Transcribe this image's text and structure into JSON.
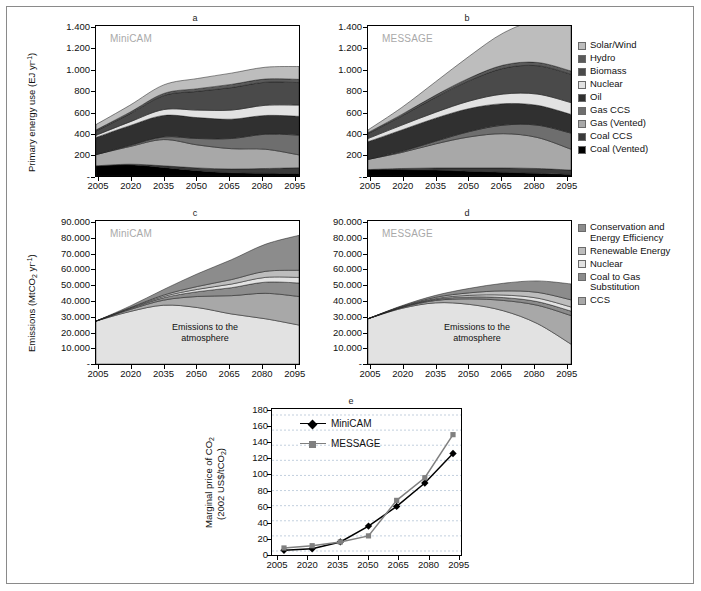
{
  "figure": {
    "panels": [
      "a",
      "b",
      "c",
      "d",
      "e"
    ]
  },
  "panel_a": {
    "letter": "a",
    "model_tag": "MiniCAM",
    "ylabel_main": "Primary energy use (EJ yr",
    "ylabel_sup": "-1",
    "ylabel_end": ")",
    "yticks": [
      "1.400",
      "1.200",
      "1.000",
      "800",
      "600",
      "400",
      "200",
      "-"
    ],
    "xticks": [
      "2005",
      "2020",
      "2035",
      "2050",
      "2065",
      "2080",
      "2095"
    ]
  },
  "panel_b": {
    "letter": "b",
    "model_tag": "MESSAGE",
    "yticks": [
      "1.400",
      "1.200",
      "1.000",
      "800",
      "600",
      "400",
      "200",
      "-"
    ],
    "xticks": [
      "2005",
      "2020",
      "2035",
      "2050",
      "2065",
      "2080",
      "2095"
    ]
  },
  "panel_c": {
    "letter": "c",
    "model_tag": "MiniCAM",
    "ylabel_pre": "Emissions (MtCO",
    "ylabel_sub": "2",
    "ylabel_mid": " yr",
    "ylabel_sup": "-1",
    "ylabel_end": ")",
    "yticks": [
      "90.000",
      "80.000",
      "70.000",
      "60.000",
      "50.000",
      "40.000",
      "30.000",
      "20.000",
      "10.000",
      "-"
    ],
    "xticks": [
      "2005",
      "2020",
      "2035",
      "2050",
      "2065",
      "2080",
      "2095"
    ],
    "area_note_line1": "Emissions to the",
    "area_note_line2": "atmosphere"
  },
  "panel_d": {
    "letter": "d",
    "model_tag": "MESSAGE",
    "yticks": [
      "90.000",
      "80.000",
      "70.000",
      "60.000",
      "50.000",
      "40.000",
      "30.000",
      "20.000",
      "10.000",
      "-"
    ],
    "xticks": [
      "2005",
      "2020",
      "2035",
      "2050",
      "2065",
      "2080",
      "2095"
    ],
    "area_note_line1": "Emissions to the",
    "area_note_line2": "atmosphere"
  },
  "panel_e": {
    "letter": "e",
    "ylabel_pre": "Marginal price of CO",
    "ylabel_sub": "2",
    "ylabel_line2_pre": "(2002 US$/tCO",
    "ylabel_line2_sub": "2",
    "ylabel_line2_end": ")",
    "yticks": [
      "180",
      "160",
      "140",
      "120",
      "100",
      "80",
      "60",
      "40",
      "20",
      "0"
    ],
    "xticks": [
      "2005",
      "2020",
      "2035",
      "2050",
      "2065",
      "2080",
      "2095"
    ],
    "legend": [
      {
        "label": "MiniCAM",
        "color": "#000000",
        "marker": "diamond"
      },
      {
        "label": "MESSAGE",
        "color": "#808080",
        "marker": "square"
      }
    ]
  },
  "legend_energy": {
    "items": [
      {
        "label": "Solar/Wind",
        "color": "#bdbdbd"
      },
      {
        "label": "Hydro",
        "color": "#5a5a5a"
      },
      {
        "label": "Biomass",
        "color": "#4a4a4a"
      },
      {
        "label": "Nuclear",
        "color": "#e2e2e2"
      },
      {
        "label": "Oil",
        "color": "#303030"
      },
      {
        "label": "Gas CCS",
        "color": "#6e6e6e"
      },
      {
        "label": "Gas (Vented)",
        "color": "#a8a8a8"
      },
      {
        "label": "Coal CCS",
        "color": "#3a3a3a"
      },
      {
        "label": "Coal (Vented)",
        "color": "#000000"
      }
    ]
  },
  "legend_emissions": {
    "items": [
      {
        "label": "Conservation and Energy Efficiency",
        "color": "#8c8c8c"
      },
      {
        "label": "Renewable Energy",
        "color": "#bdbdbd"
      },
      {
        "label": "Nuclear",
        "color": "#e2e2e2"
      },
      {
        "label": "Coal to Gas Substitution",
        "color": "#8c8c8c"
      },
      {
        "label": "CCS",
        "color": "#a8a8a8"
      }
    ]
  },
  "chart_data": [
    {
      "type": "area",
      "panel": "a",
      "title": "MiniCAM",
      "xlabel": "",
      "ylabel": "Primary energy use (EJ yr-1)",
      "x": [
        2005,
        2020,
        2035,
        2050,
        2065,
        2080,
        2095
      ],
      "xlim": [
        2005,
        2095
      ],
      "ylim": [
        0,
        1400
      ],
      "grid": false,
      "series": [
        {
          "name": "Coal (Vented)",
          "color": "#000000",
          "values": [
            95,
            105,
            80,
            50,
            30,
            25,
            22
          ]
        },
        {
          "name": "Coal CCS",
          "color": "#3a3a3a",
          "values": [
            0,
            5,
            15,
            25,
            35,
            45,
            55
          ]
        },
        {
          "name": "Gas (Vented)",
          "color": "#a8a8a8",
          "values": [
            105,
            165,
            245,
            215,
            190,
            180,
            120
          ]
        },
        {
          "name": "Gas CCS",
          "color": "#6e6e6e",
          "values": [
            0,
            10,
            25,
            60,
            95,
            140,
            185
          ]
        },
        {
          "name": "Oil",
          "color": "#303030",
          "values": [
            160,
            185,
            200,
            195,
            180,
            175,
            175
          ]
        },
        {
          "name": "Nuclear",
          "color": "#e2e2e2",
          "values": [
            20,
            35,
            55,
            70,
            85,
            95,
            105
          ]
        },
        {
          "name": "Biomass",
          "color": "#4a4a4a",
          "values": [
            40,
            75,
            130,
            175,
            210,
            215,
            210
          ]
        },
        {
          "name": "Hydro",
          "color": "#5a5a5a",
          "values": [
            10,
            15,
            20,
            25,
            30,
            30,
            30
          ]
        },
        {
          "name": "Solar/Wind",
          "color": "#bdbdbd",
          "values": [
            50,
            65,
            80,
            95,
            105,
            110,
            120
          ]
        }
      ],
      "totals": [
        480,
        660,
        850,
        910,
        960,
        1015,
        1022
      ]
    },
    {
      "type": "area",
      "panel": "b",
      "title": "MESSAGE",
      "xlabel": "",
      "ylabel": "Primary energy use (EJ yr-1)",
      "x": [
        2005,
        2020,
        2035,
        2050,
        2065,
        2080,
        2095
      ],
      "xlim": [
        2005,
        2095
      ],
      "ylim": [
        0,
        1400
      ],
      "grid": false,
      "series": [
        {
          "name": "Coal (Vented)",
          "color": "#000000",
          "values": [
            60,
            60,
            55,
            45,
            35,
            25,
            15
          ]
        },
        {
          "name": "Coal CCS",
          "color": "#3a3a3a",
          "values": [
            0,
            10,
            20,
            30,
            40,
            45,
            40
          ]
        },
        {
          "name": "Gas (Vented)",
          "color": "#a8a8a8",
          "values": [
            95,
            150,
            225,
            290,
            320,
            290,
            195
          ]
        },
        {
          "name": "Gas CCS",
          "color": "#6e6e6e",
          "values": [
            0,
            10,
            25,
            50,
            80,
            115,
            150
          ]
        },
        {
          "name": "Oil",
          "color": "#303030",
          "values": [
            165,
            200,
            215,
            215,
            200,
            185,
            175
          ]
        },
        {
          "name": "Nuclear",
          "color": "#e2e2e2",
          "values": [
            30,
            45,
            55,
            70,
            90,
            105,
            110
          ]
        },
        {
          "name": "Biomass",
          "color": "#4a4a4a",
          "values": [
            45,
            85,
            140,
            190,
            240,
            265,
            265
          ]
        },
        {
          "name": "Hydro",
          "color": "#5a5a5a",
          "values": [
            10,
            15,
            20,
            25,
            30,
            30,
            30
          ]
        },
        {
          "name": "Solar/Wind",
          "color": "#bdbdbd",
          "values": [
            25,
            65,
            125,
            205,
            300,
            390,
            455
          ]
        }
      ],
      "totals": [
        430,
        640,
        880,
        1120,
        1335,
        1450,
        1435
      ]
    },
    {
      "type": "area",
      "panel": "c",
      "title": "MiniCAM",
      "xlabel": "",
      "ylabel": "Emissions (MtCO2 yr-1)",
      "x": [
        2005,
        2020,
        2035,
        2050,
        2065,
        2080,
        2095
      ],
      "xlim": [
        2005,
        2095
      ],
      "ylim": [
        0,
        90000
      ],
      "grid": false,
      "annotation": "Emissions to the atmosphere",
      "series": [
        {
          "name": "Emissions to the atmosphere",
          "color": "#e2e2e2",
          "values": [
            27000,
            33000,
            37000,
            35500,
            31500,
            28500,
            24500
          ]
        },
        {
          "name": "CCS",
          "color": "#a8a8a8",
          "values": [
            0,
            1200,
            3200,
            7000,
            11500,
            16000,
            18000
          ]
        },
        {
          "name": "Coal to Gas Substitution",
          "color": "#8c8c8c",
          "values": [
            0,
            600,
            1500,
            3000,
            5000,
            7000,
            8500
          ]
        },
        {
          "name": "Nuclear",
          "color": "#e2e2e2",
          "values": [
            0,
            300,
            800,
            1500,
            2300,
            3000,
            3500
          ]
        },
        {
          "name": "Renewable Energy",
          "color": "#bdbdbd",
          "values": [
            0,
            300,
            900,
            1800,
            2800,
            3800,
            4500
          ]
        },
        {
          "name": "Conservation and Energy Efficiency",
          "color": "#8c8c8c",
          "values": [
            0,
            1000,
            3500,
            8000,
            12500,
            17000,
            22000
          ]
        }
      ],
      "totals": [
        27000,
        36400,
        46900,
        56800,
        65600,
        75300,
        81000
      ]
    },
    {
      "type": "area",
      "panel": "d",
      "title": "MESSAGE",
      "xlabel": "",
      "ylabel": "Emissions (MtCO2 yr-1)",
      "x": [
        2005,
        2020,
        2035,
        2050,
        2065,
        2080,
        2095
      ],
      "xlim": [
        2005,
        2095
      ],
      "ylim": [
        0,
        90000
      ],
      "grid": false,
      "annotation": "Emissions to the atmosphere",
      "series": [
        {
          "name": "Emissions to the atmosphere",
          "color": "#e2e2e2",
          "values": [
            28500,
            35000,
            38500,
            37500,
            33500,
            25500,
            12500
          ]
        },
        {
          "name": "CCS",
          "color": "#a8a8a8",
          "values": [
            0,
            500,
            1500,
            3500,
            6500,
            11500,
            18000
          ]
        },
        {
          "name": "Coal to Gas Substitution",
          "color": "#8c8c8c",
          "values": [
            0,
            300,
            700,
            1200,
            1800,
            2300,
            2800
          ]
        },
        {
          "name": "Nuclear",
          "color": "#e2e2e2",
          "values": [
            0,
            200,
            500,
            1000,
            1600,
            2200,
            2600
          ]
        },
        {
          "name": "Renewable Energy",
          "color": "#bdbdbd",
          "values": [
            0,
            300,
            800,
            1600,
            2600,
            3600,
            4500
          ]
        },
        {
          "name": "Conservation and Energy Efficiency",
          "color": "#8c8c8c",
          "values": [
            0,
            400,
            1200,
            2800,
            4800,
            7200,
            10000
          ]
        }
      ],
      "totals": [
        28500,
        36700,
        43200,
        47600,
        50800,
        52300,
        50400
      ]
    },
    {
      "type": "line",
      "panel": "e",
      "title": "",
      "xlabel": "",
      "ylabel": "Marginal price of CO2 (2002 US$/tCO2)",
      "x": [
        2005,
        2020,
        2035,
        2050,
        2065,
        2080,
        2095
      ],
      "xlim": [
        2005,
        2095
      ],
      "ylim": [
        0,
        180
      ],
      "ytick_step": 20,
      "grid": true,
      "series": [
        {
          "name": "MiniCAM",
          "color": "#000000",
          "marker": "diamond",
          "values": [
            1,
            3,
            12,
            33,
            59,
            90,
            129
          ]
        },
        {
          "name": "MESSAGE",
          "color": "#808080",
          "marker": "square",
          "values": [
            4,
            7,
            12,
            20,
            67,
            97,
            154
          ]
        }
      ]
    }
  ]
}
